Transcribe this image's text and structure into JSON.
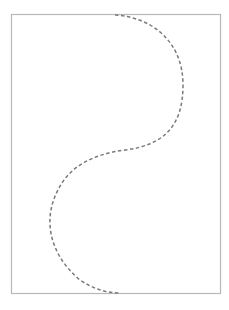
{
  "diagram": {
    "frame_color": "#b8b8b8",
    "curve_color": "#7a7a7a",
    "curve_style": "dashed"
  }
}
